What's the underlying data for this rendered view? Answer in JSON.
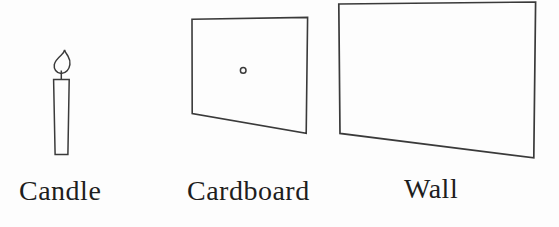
{
  "figure": {
    "labels": {
      "candle": "Candle",
      "cardboard": "Cardboard",
      "wall": "Wall"
    },
    "icons": {
      "candle": "candle-with-flame-icon",
      "cardboard": "cardboard-with-pinhole-icon",
      "wall": "wall-panel-icon"
    },
    "colors": {
      "line": "#3a3a3a",
      "text": "#1e1e1e",
      "background": "#fdfdfd"
    }
  }
}
